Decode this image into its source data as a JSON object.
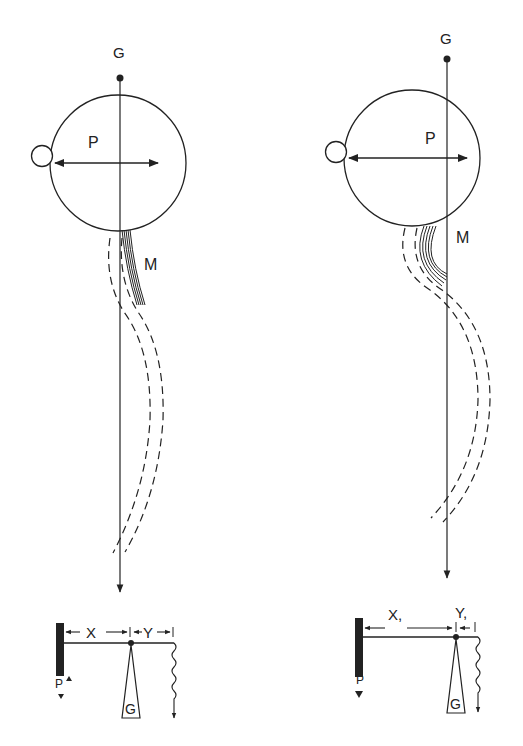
{
  "figures": [
    {
      "id": "left",
      "labels": {
        "gravity": "G",
        "pivot_force": "P",
        "muscle": "M",
        "lever_x": "X",
        "lever_y": "Y",
        "lever_p": "P",
        "lever_g": "G"
      }
    },
    {
      "id": "right",
      "labels": {
        "gravity": "G",
        "pivot_force": "P",
        "muscle": "M",
        "lever_x": "X,",
        "lever_y": "Y,",
        "lever_p": "P",
        "lever_g": "G"
      }
    }
  ],
  "colors": {
    "stroke": "#222222",
    "background": "#ffffff"
  }
}
